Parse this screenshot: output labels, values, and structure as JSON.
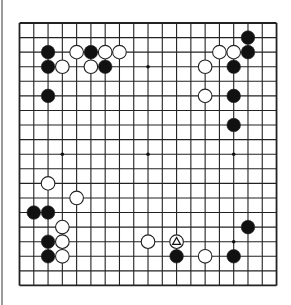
{
  "board": {
    "size": 19,
    "origin_x": 19.5,
    "origin_y": 23,
    "spacing_x": 14.28,
    "spacing_y": 14.58,
    "line_color": "#222222",
    "background": "#ffffff",
    "star_points": [
      [
        3,
        3
      ],
      [
        9,
        3
      ],
      [
        15,
        3
      ],
      [
        3,
        9
      ],
      [
        9,
        9
      ],
      [
        15,
        9
      ],
      [
        3,
        15
      ],
      [
        9,
        15
      ],
      [
        15,
        15
      ]
    ],
    "stones": [
      {
        "color": "black",
        "col": 2,
        "row": 2
      },
      {
        "color": "white",
        "col": 4,
        "row": 2
      },
      {
        "color": "black",
        "col": 5,
        "row": 2
      },
      {
        "color": "white",
        "col": 6,
        "row": 2
      },
      {
        "color": "white",
        "col": 7,
        "row": 2
      },
      {
        "color": "black",
        "col": 2,
        "row": 3
      },
      {
        "color": "white",
        "col": 3,
        "row": 3
      },
      {
        "color": "white",
        "col": 5,
        "row": 3
      },
      {
        "color": "black",
        "col": 6,
        "row": 3
      },
      {
        "color": "black",
        "col": 2,
        "row": 5
      },
      {
        "color": "black",
        "col": 16,
        "row": 1
      },
      {
        "color": "white",
        "col": 14,
        "row": 2
      },
      {
        "color": "white",
        "col": 15,
        "row": 2
      },
      {
        "color": "black",
        "col": 16,
        "row": 2
      },
      {
        "color": "white",
        "col": 13,
        "row": 3
      },
      {
        "color": "black",
        "col": 15,
        "row": 3
      },
      {
        "color": "white",
        "col": 13,
        "row": 5
      },
      {
        "color": "black",
        "col": 15,
        "row": 5
      },
      {
        "color": "black",
        "col": 15,
        "row": 7
      },
      {
        "color": "white",
        "col": 2,
        "row": 11
      },
      {
        "color": "white",
        "col": 4,
        "row": 12
      },
      {
        "color": "black",
        "col": 1,
        "row": 13
      },
      {
        "color": "black",
        "col": 2,
        "row": 13
      },
      {
        "color": "white",
        "col": 3,
        "row": 14
      },
      {
        "color": "black",
        "col": 2,
        "row": 15
      },
      {
        "color": "white",
        "col": 3,
        "row": 15
      },
      {
        "color": "black",
        "col": 2,
        "row": 16
      },
      {
        "color": "white",
        "col": 3,
        "row": 16
      },
      {
        "color": "black",
        "col": 16,
        "row": 14
      },
      {
        "color": "white",
        "col": 9,
        "row": 15
      },
      {
        "color": "white",
        "col": 11,
        "row": 15,
        "marker": "triangle"
      },
      {
        "color": "black",
        "col": 11,
        "row": 16
      },
      {
        "color": "white",
        "col": 13,
        "row": 16
      },
      {
        "color": "black",
        "col": 15,
        "row": 16
      }
    ]
  }
}
